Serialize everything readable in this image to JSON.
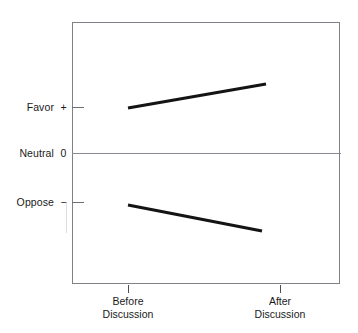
{
  "chart_data": {
    "type": "line",
    "title": "",
    "subtitle": "",
    "xlabel": "",
    "ylabel": "",
    "categories": [
      "Before Discussion",
      "After Discussion"
    ],
    "x": [
      0,
      1
    ],
    "xlim": [
      -0.42,
      1.45
    ],
    "ylim": [
      -2.15,
      2.15
    ],
    "grid": false,
    "legend": null,
    "y_axis": {
      "ticks": [
        {
          "value": 1,
          "sign": "+",
          "label": "Favor",
          "pixel_y": 107
        },
        {
          "value": 0,
          "sign": "0",
          "label": "Neutral",
          "pixel_y": 153
        },
        {
          "value": -1,
          "sign": "−",
          "label": "Oppose",
          "pixel_y": 202
        }
      ]
    },
    "x_axis": {
      "ticks": [
        {
          "label_line1": "Before",
          "label_line2": "Discussion",
          "pixel_x": 128
        },
        {
          "label_line1": "After",
          "label_line2": "Discussion",
          "pixel_x": 280
        }
      ]
    },
    "series": [
      {
        "name": "Initially favorable group",
        "color": "#141414",
        "values": [
          0.98,
          1.5
        ],
        "points": [
          {
            "x": "Before Discussion",
            "y": 0.98,
            "pixel_x": 128,
            "pixel_y": 108
          },
          {
            "x": "After Discussion",
            "y": 1.5,
            "pixel_x": 266,
            "pixel_y": 84
          }
        ],
        "direction": "increasing"
      },
      {
        "name": "Initially opposed group",
        "color": "#141414",
        "values": [
          -1.13,
          -1.7
        ],
        "points": [
          {
            "x": "Before Discussion",
            "y": -1.13,
            "pixel_x": 128,
            "pixel_y": 205
          },
          {
            "x": "After Discussion",
            "y": -1.7,
            "pixel_x": 262,
            "pixel_y": 231
          }
        ],
        "direction": "decreasing"
      }
    ],
    "annotations": [],
    "colors": {
      "line": "#141414",
      "frame": "#808086",
      "zero_line": "#8a8a90",
      "tick": "#6e6e74",
      "text": "#1a1a1a",
      "background": "#ffffff"
    }
  },
  "axis_labels": {
    "favor": {
      "text": "Favor",
      "sign": "+"
    },
    "neutral": {
      "text": "Neutral",
      "sign": "0"
    },
    "oppose": {
      "text": "Oppose",
      "sign": "−"
    }
  },
  "x_ticks": [
    {
      "line1": "Before",
      "line2": "Discussion"
    },
    {
      "line1": "After",
      "line2": "Discussion"
    }
  ]
}
